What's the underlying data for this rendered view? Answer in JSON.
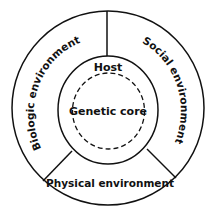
{
  "diagram": {
    "labels": {
      "host": "Host",
      "core": "Genetic core",
      "biologic": "Biologic environment",
      "social": "Social environment",
      "physical": "Physical environment"
    },
    "colors": {
      "stroke": "#111111",
      "background": "#ffffff"
    }
  }
}
